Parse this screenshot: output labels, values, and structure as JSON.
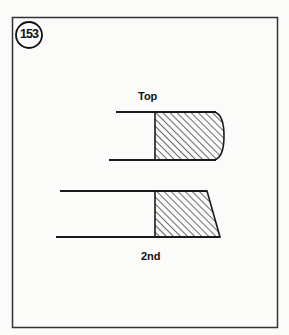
{
  "figure": {
    "number": "153",
    "labels": {
      "top": "Top",
      "second": "2nd"
    },
    "colors": {
      "stroke": "#1a1a1a",
      "background": "#fbfbfa",
      "frame": "#333333"
    }
  }
}
